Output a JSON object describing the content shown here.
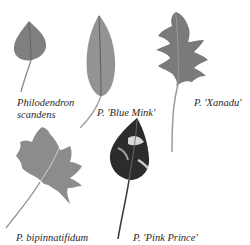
{
  "figure": {
    "background": "#ffffff",
    "leaf_colors": {
      "scandens": "#7d7d7d",
      "blue_mink": "#8e8e8e",
      "xanadu": "#7a7a7a",
      "bipinnatifidum": "#8a8a8a",
      "pink_prince": "#2e2e2e"
    },
    "captions": [
      {
        "id": "scandens",
        "line1": "Philodendron",
        "line2": "scandens"
      },
      {
        "id": "blue_mink",
        "line1": "P. 'Blue Mink'"
      },
      {
        "id": "xanadu",
        "line1": "P. 'Xanadu'"
      },
      {
        "id": "bipinnatifidum",
        "line1": "P. bipinnatifidum"
      },
      {
        "id": "pink_prince",
        "line1": "P. 'Pink Prince'"
      }
    ]
  }
}
